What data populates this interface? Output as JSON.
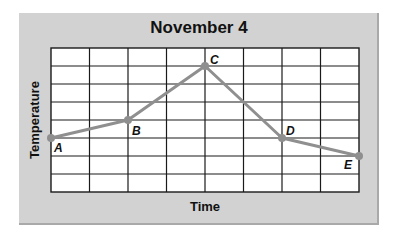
{
  "chart_data": {
    "type": "line",
    "title": "November 4",
    "xlabel": "Time",
    "ylabel": "Temperature",
    "grid": true,
    "x_divisions": 8,
    "y_divisions": 8,
    "xlim": [
      0,
      8
    ],
    "ylim": [
      0,
      8
    ],
    "tick_labels_shown": false,
    "series": [
      {
        "name": "Temperature",
        "color": "#8f8f8f",
        "points": [
          {
            "label": "A",
            "x": 0,
            "y": 3
          },
          {
            "label": "B",
            "x": 2,
            "y": 4
          },
          {
            "label": "C",
            "x": 4,
            "y": 7
          },
          {
            "label": "D",
            "x": 6,
            "y": 3
          },
          {
            "label": "E",
            "x": 8,
            "y": 2
          }
        ]
      }
    ]
  },
  "colors": {
    "frame_bg": "#d2d2d2",
    "plot_bg": "#ffffff",
    "grid": "#1a1a1a",
    "line": "#8f8f8f"
  }
}
